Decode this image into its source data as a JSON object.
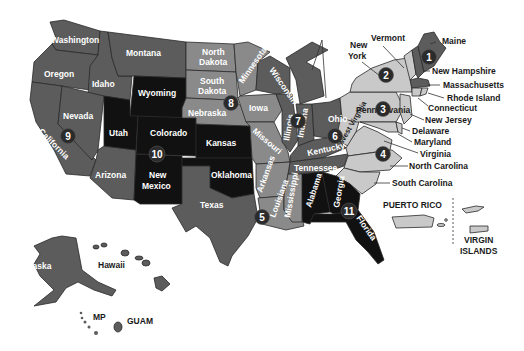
{
  "map": {
    "title": "US Regions Map",
    "colors": {
      "dark_gray": "#5c5c5c",
      "mid_gray": "#8a8a8a",
      "light_gray": "#c9c9c9",
      "black": "#111111",
      "badge": "#2b2b2b"
    },
    "regions": [
      {
        "number": "1",
        "states": [
          "Maine",
          "New Hampshire",
          "Vermont",
          "Massachusetts",
          "Rhode Island",
          "Connecticut"
        ]
      },
      {
        "number": "2",
        "states": [
          "New York",
          "New Jersey",
          "Puerto Rico",
          "Virgin Islands"
        ]
      },
      {
        "number": "3",
        "states": [
          "Pennsylvania",
          "Delaware",
          "Maryland",
          "Virginia",
          "West Virginia"
        ]
      },
      {
        "number": "4",
        "states": [
          "North Carolina",
          "South Carolina",
          "Tennessee",
          "Kentucky"
        ]
      },
      {
        "number": "5",
        "states": [
          "Louisiana",
          "Arkansas",
          "Mississippi"
        ]
      },
      {
        "number": "6",
        "states": [
          "Ohio",
          "Indiana",
          "Michigan",
          "Kentucky"
        ]
      },
      {
        "number": "7",
        "states": [
          "Illinois",
          "Wisconsin",
          "Minnesota"
        ]
      },
      {
        "number": "8",
        "states": [
          "North Dakota",
          "South Dakota",
          "Nebraska",
          "Iowa",
          "Missouri"
        ]
      },
      {
        "number": "9",
        "states": [
          "California",
          "Nevada",
          "Hawaii",
          "Guam",
          "MP"
        ]
      },
      {
        "number": "10",
        "states": [
          "Utah",
          "Colorado",
          "Wyoming",
          "New Mexico",
          "Kansas",
          "Oklahoma"
        ]
      },
      {
        "number": "11",
        "states": [
          "Georgia",
          "Florida",
          "Alabama"
        ]
      }
    ],
    "state_labels": {
      "washington": "Washington",
      "oregon": "Oregon",
      "idaho": "Idaho",
      "montana": "Montana",
      "wyoming": "Wyoming",
      "nevada": "Nevada",
      "california": "California",
      "utah": "Utah",
      "colorado": "Colorado",
      "arizona": "Arizona",
      "new_mexico_1": "New",
      "new_mexico_2": "Mexico",
      "north_dakota_1": "North",
      "north_dakota_2": "Dakota",
      "south_dakota_1": "South",
      "south_dakota_2": "Dakota",
      "nebraska": "Nebraska",
      "kansas": "Kansas",
      "oklahoma": "Oklahoma",
      "texas": "Texas",
      "minnesota": "Minnesota",
      "iowa": "Iowa",
      "missouri": "Missouri",
      "arkansas": "Arkansas",
      "louisiana": "Louisiana",
      "wisconsin": "Wisconsin",
      "illinois": "Illinois",
      "michigan": "Michigan",
      "indiana": "Indiana",
      "ohio": "Ohio",
      "kentucky": "Kentucky",
      "tennessee": "Tennessee",
      "mississippi": "Mississippi",
      "alabama": "Alabama",
      "georgia": "Georgia",
      "florida": "Florida",
      "south_carolina": "South Carolina",
      "north_carolina": "North Carolina",
      "virginia": "Virginia",
      "west_virginia": "West Virginia",
      "maryland": "Maryland",
      "delaware": "Delaware",
      "new_jersey": "New Jersey",
      "pennsylvania": "Pennsylvania",
      "new_york_1": "New",
      "new_york_2": "York",
      "vermont": "Vermont",
      "maine": "Maine",
      "new_hampshire": "New Hampshire",
      "massachusetts": "Massachusetts",
      "rhode_island": "Rhode Island",
      "connecticut": "Connecticut",
      "alaska": "Alaska",
      "hawaii": "Hawaii",
      "mp": "MP",
      "guam": "GUAM",
      "puerto_rico": "PUERTO RICO",
      "virgin_islands_1": "VIRGIN",
      "virgin_islands_2": "ISLANDS"
    },
    "badges": [
      "1",
      "2",
      "3",
      "4",
      "5",
      "6",
      "7",
      "8",
      "9",
      "10",
      "11"
    ]
  }
}
